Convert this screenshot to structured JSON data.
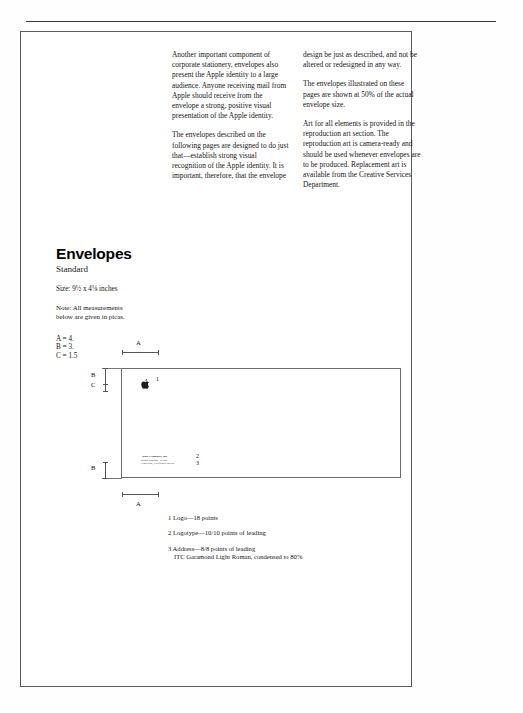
{
  "page": {
    "title": "Envelopes",
    "subtitle": "Standard"
  },
  "body_text": {
    "column_left": [
      "Another important component of corporate stationery, envelopes also present the Apple identity to a large audience. Anyone receiving mail from Apple should receive from the envelope a strong, positive visual presentation of the Apple identity.",
      "The envelopes described on the following pages are designed to do just that—establish strong visual recognition of the Apple identity. It is important, therefore, that the envelope"
    ],
    "column_right": [
      "design be just as described, and not be altered or redesigned in any way.",
      "The envelopes illustrated on these pages are shown at 50% of the actual envelope size.",
      "Art for all elements is provided in the reproduction art section. The reproduction art is camera-ready and should be used whenever envelopes are to be produced. Replacement art is available from the Creative Services Department."
    ]
  },
  "spec": {
    "size_line": "Size: 9½ x 4⅛ inches",
    "note_line_1": "Note: All measurements",
    "note_line_2": "below are given in picas.",
    "measurements": [
      "A = 4.",
      "B = 3.",
      "C = 1.5"
    ]
  },
  "diagram": {
    "dimension_labels": {
      "a_top": "A",
      "a_bottom": "A",
      "b_top": "B",
      "b_bottom": "B",
      "c": "C"
    },
    "callouts": {
      "logo": "1",
      "logotype": "2",
      "address": "3"
    },
    "envelope_address": {
      "company": "Apple Computer, Inc.",
      "street": "20525 Mariani Avenue",
      "city": "Cupertino, California 95014"
    },
    "apple_logo_alt": "apple-logo"
  },
  "legend": {
    "items": [
      {
        "number": "1",
        "text": "Logo—18 points",
        "sub": ""
      },
      {
        "number": "2",
        "text": "Logotype—10/10 points of leading",
        "sub": ""
      },
      {
        "number": "3",
        "text": "Address—8/8 points of leading",
        "sub": "ITC Garamond Light Roman, condensed to 80%"
      }
    ]
  },
  "colors": {
    "page_background": "#ffffff",
    "text": "#161616",
    "rule": "#5c5c5c",
    "diagram_line": "#6b6b6b"
  }
}
